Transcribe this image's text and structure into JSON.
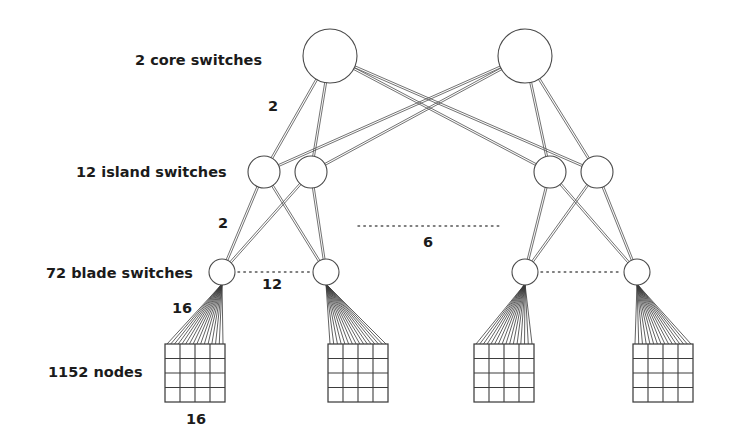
{
  "figure": {
    "background_color": "#ffffff",
    "ink_color": "#3d3d3d"
  },
  "tier_labels": [
    {
      "id": "core",
      "text": "2 core switches",
      "x": 135,
      "y": 65
    },
    {
      "id": "island",
      "text": "12 island switches",
      "x": 76,
      "y": 177
    },
    {
      "id": "blade",
      "text": "72 blade switches",
      "x": 46,
      "y": 278
    },
    {
      "id": "nodes",
      "text": "1152 nodes",
      "x": 48,
      "y": 377
    }
  ],
  "link_count_labels": [
    {
      "id": "core-to-island-count",
      "text": "2",
      "x": 268,
      "y": 111
    },
    {
      "id": "island-to-blade-count",
      "text": "2",
      "x": 218,
      "y": 228
    },
    {
      "id": "island-group-count",
      "text": "6",
      "x": 423,
      "y": 247
    },
    {
      "id": "blade-group-count",
      "text": "12",
      "x": 262,
      "y": 289
    },
    {
      "id": "node-uplink-count",
      "text": "16",
      "x": 172,
      "y": 313
    },
    {
      "id": "node-grid-width-count",
      "text": "16",
      "x": 186,
      "y": 424
    }
  ],
  "core_switches": [
    {
      "id": "core-switch-left",
      "cx": 330,
      "cy": 56,
      "r": 27
    },
    {
      "id": "core-switch-right",
      "cx": 525,
      "cy": 56,
      "r": 27
    }
  ],
  "island_switches": [
    {
      "id": "island-switch-1",
      "cx": 264,
      "cy": 172,
      "r": 16
    },
    {
      "id": "island-switch-2",
      "cx": 311,
      "cy": 172,
      "r": 16
    },
    {
      "id": "island-switch-3",
      "cx": 550,
      "cy": 172,
      "r": 16
    },
    {
      "id": "island-switch-4",
      "cx": 597,
      "cy": 172,
      "r": 16
    }
  ],
  "blade_switches": [
    {
      "id": "blade-switch-1",
      "cx": 222,
      "cy": 272,
      "r": 13
    },
    {
      "id": "blade-switch-2",
      "cx": 326,
      "cy": 272,
      "r": 13
    },
    {
      "id": "blade-switch-3",
      "cx": 525,
      "cy": 272,
      "r": 13
    },
    {
      "id": "blade-switch-4",
      "cx": 637,
      "cy": 272,
      "r": 13
    }
  ],
  "node_grids": [
    {
      "id": "node-grid-1",
      "x": 165,
      "y": 344,
      "w": 60,
      "h": 58,
      "cols": 4,
      "rows": 4
    },
    {
      "id": "node-grid-2",
      "x": 328,
      "y": 344,
      "w": 60,
      "h": 58,
      "cols": 4,
      "rows": 4
    },
    {
      "id": "node-grid-3",
      "x": 474,
      "y": 344,
      "w": 60,
      "h": 58,
      "cols": 4,
      "rows": 4
    },
    {
      "id": "node-grid-4",
      "x": 633,
      "y": 344,
      "w": 60,
      "h": 58,
      "cols": 4,
      "rows": 4
    }
  ],
  "dotted_links": [
    {
      "id": "island-ellipsis",
      "x1": 358,
      "y1": 226,
      "x2": 499,
      "y2": 226
    },
    {
      "id": "blade-ellipsis-left",
      "x1": 238,
      "y1": 272,
      "x2": 310,
      "y2": 272
    },
    {
      "id": "blade-ellipsis-right",
      "x1": 541,
      "y1": 272,
      "x2": 621,
      "y2": 272
    }
  ],
  "topology": {
    "core_to_island_edges": [
      [
        "core-switch-left",
        "island-switch-1"
      ],
      [
        "core-switch-left",
        "island-switch-2"
      ],
      [
        "core-switch-left",
        "island-switch-3"
      ],
      [
        "core-switch-left",
        "island-switch-4"
      ],
      [
        "core-switch-right",
        "island-switch-1"
      ],
      [
        "core-switch-right",
        "island-switch-2"
      ],
      [
        "core-switch-right",
        "island-switch-3"
      ],
      [
        "core-switch-right",
        "island-switch-4"
      ]
    ],
    "island_to_blade_edges": [
      [
        "island-switch-1",
        "blade-switch-1"
      ],
      [
        "island-switch-1",
        "blade-switch-2"
      ],
      [
        "island-switch-2",
        "blade-switch-1"
      ],
      [
        "island-switch-2",
        "blade-switch-2"
      ],
      [
        "island-switch-3",
        "blade-switch-3"
      ],
      [
        "island-switch-3",
        "blade-switch-4"
      ],
      [
        "island-switch-4",
        "blade-switch-3"
      ],
      [
        "island-switch-4",
        "blade-switch-4"
      ]
    ],
    "blade_to_grid_edges": [
      [
        "blade-switch-1",
        "node-grid-1"
      ],
      [
        "blade-switch-2",
        "node-grid-2"
      ],
      [
        "blade-switch-3",
        "node-grid-3"
      ],
      [
        "blade-switch-4",
        "node-grid-4"
      ]
    ],
    "link_multiplicity": 2,
    "node_fan_lines": 16
  }
}
